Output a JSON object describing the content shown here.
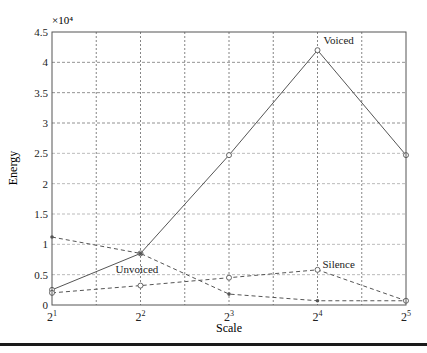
{
  "chart_data": {
    "type": "line",
    "title": "",
    "xlabel": "Scale",
    "ylabel": "Energy",
    "y_multiplier_label": "×10⁴",
    "y_multiplier": 10000,
    "x": [
      1,
      2,
      3,
      4,
      5
    ],
    "categories": [
      "2^1",
      "2^2",
      "2^3",
      "2^4",
      "2^5"
    ],
    "x_tick_base": "2",
    "x_tick_exponents": [
      "1",
      "2",
      "3",
      "4",
      "5"
    ],
    "ylim": [
      0,
      4.5
    ],
    "yticks": [
      "0",
      "0.5",
      "1",
      "1.5",
      "2",
      "2.5",
      "3",
      "3.5",
      "4",
      "4.5"
    ],
    "grid": true,
    "legend": "inline annotations",
    "series": [
      {
        "name": "Voiced",
        "values": [
          0.25,
          0.85,
          2.47,
          4.2,
          2.47
        ],
        "line": "solid",
        "marker": "circle",
        "label_at": 3
      },
      {
        "name": "Unvoiced",
        "values": [
          1.12,
          0.85,
          0.18,
          0.07,
          0.07
        ],
        "line": "dashed",
        "marker": "dot",
        "label_at": 1
      },
      {
        "name": "Silence",
        "values": [
          0.2,
          0.32,
          0.45,
          0.58,
          0.07
        ],
        "line": "dashed",
        "marker": "circle",
        "label_at": 3
      }
    ]
  },
  "colors": {
    "axis": "#555555",
    "grid_major": "#777777",
    "grid_minor": "#aaaaaa",
    "line": "#555555",
    "text": "#222222"
  }
}
